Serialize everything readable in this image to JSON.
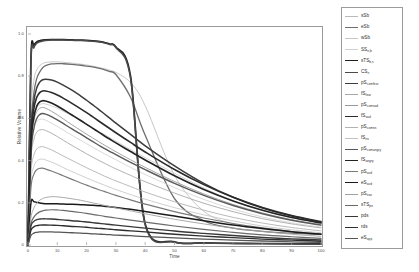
{
  "figure": {
    "xlabel": "Time",
    "ylabel": "Relative Volume"
  },
  "chart_data": {
    "type": "line",
    "title": "",
    "xlabel": "Time",
    "ylabel": "Relative Volume",
    "xlim": [
      0,
      100
    ],
    "ylim": [
      0,
      1.0
    ],
    "xticks": [
      0,
      10,
      20,
      30,
      40,
      50,
      60,
      70,
      80,
      90,
      100
    ],
    "xtick_labels": [
      "0",
      "10",
      "20",
      "30",
      "40",
      "50",
      "60",
      "70",
      "80",
      "90",
      "100"
    ],
    "yticks": [
      0,
      0.2,
      0.4,
      0.6,
      0.8,
      1.0
    ],
    "ytick_labels": [
      "0",
      "0.2",
      "0.4",
      "0.6",
      "0.8",
      "1.0"
    ],
    "grid": false,
    "legend_position": "right-outside",
    "x": [
      0,
      1,
      2,
      3,
      4,
      5,
      6,
      8,
      10,
      12,
      15,
      18,
      20,
      22,
      24,
      26,
      28,
      30,
      35,
      40,
      50,
      60,
      70,
      80,
      90,
      100
    ],
    "series": [
      {
        "name": "sSb",
        "color": "#b9b9b9",
        "width": 0.8,
        "values": [
          0.0,
          0.62,
          0.78,
          0.83,
          0.85,
          0.86,
          0.865,
          0.868,
          0.868,
          0.866,
          0.862,
          0.857,
          0.853,
          0.848,
          0.842,
          0.836,
          0.828,
          0.818,
          0.77,
          0.66,
          0.33,
          0.16,
          0.1,
          0.075,
          0.062,
          0.055
        ]
      },
      {
        "name": "eSb",
        "color": "#6e6e6e",
        "width": 1.3,
        "values": [
          0.0,
          0.55,
          0.72,
          0.79,
          0.82,
          0.84,
          0.85,
          0.858,
          0.86,
          0.859,
          0.856,
          0.852,
          0.848,
          0.844,
          0.838,
          0.831,
          0.822,
          0.808,
          0.7,
          0.52,
          0.22,
          0.115,
          0.08,
          0.065,
          0.056,
          0.05
        ]
      },
      {
        "name": "wSb",
        "color": "#c6c6c6",
        "width": 0.8,
        "values": [
          0.0,
          0.48,
          0.6,
          0.65,
          0.665,
          0.67,
          0.668,
          0.66,
          0.648,
          0.634,
          0.612,
          0.588,
          0.572,
          0.556,
          0.54,
          0.524,
          0.508,
          0.492,
          0.452,
          0.414,
          0.34,
          0.27,
          0.21,
          0.165,
          0.13,
          0.105
        ]
      },
      {
        "name": "SSn,b",
        "color": "#cfcfcf",
        "width": 0.8,
        "values": [
          0.0,
          0.44,
          0.55,
          0.585,
          0.595,
          0.597,
          0.592,
          0.578,
          0.562,
          0.545,
          0.52,
          0.496,
          0.48,
          0.464,
          0.448,
          0.433,
          0.418,
          0.404,
          0.368,
          0.334,
          0.272,
          0.216,
          0.17,
          0.133,
          0.105,
          0.085
        ]
      },
      {
        "name": "sTSb,s",
        "color": "#1f1f1f",
        "width": 1.7,
        "values": [
          0.0,
          0.88,
          0.945,
          0.962,
          0.968,
          0.971,
          0.972,
          0.973,
          0.973,
          0.973,
          0.972,
          0.971,
          0.97,
          0.968,
          0.965,
          0.96,
          0.952,
          0.938,
          0.8,
          0.1,
          0.015,
          0.01,
          0.008,
          0.007,
          0.006,
          0.005
        ]
      },
      {
        "name": "CSn",
        "color": "#4a4a4a",
        "width": 1.5,
        "values": [
          0.0,
          0.86,
          0.935,
          0.956,
          0.963,
          0.967,
          0.969,
          0.971,
          0.971,
          0.971,
          0.97,
          0.969,
          0.968,
          0.966,
          0.963,
          0.958,
          0.95,
          0.935,
          0.79,
          0.095,
          0.014,
          0.009,
          0.007,
          0.006,
          0.005,
          0.004
        ]
      },
      {
        "name": "pScomfear",
        "color": "#3c3c3c",
        "width": 1.5,
        "values": [
          0.0,
          0.52,
          0.68,
          0.745,
          0.772,
          0.783,
          0.786,
          0.782,
          0.772,
          0.758,
          0.734,
          0.706,
          0.686,
          0.665,
          0.644,
          0.622,
          0.6,
          0.578,
          0.524,
          0.47,
          0.375,
          0.292,
          0.226,
          0.175,
          0.137,
          0.108
        ]
      },
      {
        "name": "fSfear",
        "color": "#a8a8a8",
        "width": 0.9,
        "values": [
          0.0,
          0.4,
          0.5,
          0.535,
          0.545,
          0.547,
          0.543,
          0.53,
          0.514,
          0.497,
          0.472,
          0.448,
          0.432,
          0.417,
          0.402,
          0.388,
          0.374,
          0.361,
          0.33,
          0.3,
          0.246,
          0.198,
          0.158,
          0.125,
          0.1,
          0.081
        ]
      },
      {
        "name": "pScomsad",
        "color": "#9a9a9a",
        "width": 0.9,
        "values": [
          0.0,
          0.46,
          0.585,
          0.632,
          0.648,
          0.652,
          0.648,
          0.634,
          0.617,
          0.598,
          0.57,
          0.543,
          0.525,
          0.508,
          0.491,
          0.474,
          0.458,
          0.442,
          0.404,
          0.368,
          0.301,
          0.242,
          0.192,
          0.152,
          0.12,
          0.096
        ]
      },
      {
        "name": "fSsad",
        "color": "#2b2b2b",
        "width": 1.6,
        "values": [
          0.0,
          0.5,
          0.645,
          0.7,
          0.722,
          0.73,
          0.73,
          0.723,
          0.711,
          0.696,
          0.671,
          0.645,
          0.627,
          0.608,
          0.589,
          0.57,
          0.551,
          0.532,
          0.486,
          0.441,
          0.358,
          0.286,
          0.226,
          0.178,
          0.14,
          0.111
        ]
      },
      {
        "name": "pScomns",
        "color": "#b2b2b2",
        "width": 0.9,
        "values": [
          0.0,
          0.34,
          0.425,
          0.455,
          0.464,
          0.466,
          0.462,
          0.451,
          0.437,
          0.422,
          0.401,
          0.38,
          0.366,
          0.353,
          0.34,
          0.327,
          0.315,
          0.304,
          0.277,
          0.251,
          0.205,
          0.165,
          0.131,
          0.104,
          0.083,
          0.067
        ]
      },
      {
        "name": "fSns",
        "color": "#c2c2c2",
        "width": 0.8,
        "values": [
          0.0,
          0.3,
          0.372,
          0.398,
          0.406,
          0.407,
          0.403,
          0.393,
          0.381,
          0.367,
          0.348,
          0.33,
          0.318,
          0.306,
          0.295,
          0.284,
          0.273,
          0.263,
          0.239,
          0.217,
          0.177,
          0.143,
          0.114,
          0.09,
          0.072,
          0.058
        ]
      },
      {
        "name": "pScomangry",
        "color": "#5a5a5a",
        "width": 1.4,
        "values": [
          0.0,
          0.43,
          0.552,
          0.6,
          0.618,
          0.623,
          0.62,
          0.608,
          0.593,
          0.576,
          0.55,
          0.525,
          0.508,
          0.491,
          0.474,
          0.458,
          0.443,
          0.428,
          0.392,
          0.357,
          0.292,
          0.235,
          0.187,
          0.148,
          0.117,
          0.094
        ]
      },
      {
        "name": "fSangry",
        "color": "#222222",
        "width": 1.6,
        "values": [
          0.0,
          0.47,
          0.605,
          0.658,
          0.678,
          0.684,
          0.682,
          0.673,
          0.659,
          0.642,
          0.616,
          0.59,
          0.572,
          0.554,
          0.536,
          0.518,
          0.501,
          0.484,
          0.443,
          0.403,
          0.328,
          0.263,
          0.209,
          0.165,
          0.13,
          0.104
        ]
      },
      {
        "name": "pSavd",
        "color": "#7a7a7a",
        "width": 1.2,
        "values": [
          0.0,
          0.27,
          0.335,
          0.357,
          0.363,
          0.364,
          0.36,
          0.351,
          0.34,
          0.328,
          0.311,
          0.294,
          0.284,
          0.273,
          0.263,
          0.254,
          0.244,
          0.235,
          0.214,
          0.194,
          0.158,
          0.128,
          0.102,
          0.081,
          0.064,
          0.052
        ]
      },
      {
        "name": "eSavd",
        "color": "#1a1a1a",
        "width": 1.5,
        "values": [
          0.0,
          0.2,
          0.205,
          0.202,
          0.199,
          0.197,
          0.196,
          0.195,
          0.195,
          0.194,
          0.193,
          0.191,
          0.19,
          0.188,
          0.186,
          0.184,
          0.181,
          0.178,
          0.169,
          0.159,
          0.137,
          0.115,
          0.095,
          0.078,
          0.063,
          0.051
        ]
      },
      {
        "name": "pSsso",
        "color": "#a0a0a0",
        "width": 0.9,
        "values": [
          0.0,
          0.13,
          0.175,
          0.198,
          0.212,
          0.22,
          0.225,
          0.229,
          0.228,
          0.225,
          0.219,
          0.212,
          0.206,
          0.2,
          0.194,
          0.188,
          0.182,
          0.176,
          0.162,
          0.148,
          0.122,
          0.1,
          0.08,
          0.064,
          0.051,
          0.041
        ]
      },
      {
        "name": "sTSpe",
        "color": "#6a6a6a",
        "width": 1.2,
        "values": [
          0.0,
          0.1,
          0.132,
          0.148,
          0.157,
          0.162,
          0.165,
          0.167,
          0.166,
          0.164,
          0.159,
          0.154,
          0.15,
          0.145,
          0.141,
          0.136,
          0.132,
          0.128,
          0.118,
          0.108,
          0.09,
          0.074,
          0.06,
          0.048,
          0.039,
          0.031
        ]
      },
      {
        "name": "pds",
        "color": "#383838",
        "width": 1.4,
        "values": [
          0.0,
          0.09,
          0.112,
          0.12,
          0.123,
          0.124,
          0.124,
          0.123,
          0.121,
          0.119,
          0.115,
          0.112,
          0.109,
          0.106,
          0.103,
          0.1,
          0.097,
          0.094,
          0.087,
          0.08,
          0.066,
          0.055,
          0.045,
          0.036,
          0.029,
          0.024
        ]
      },
      {
        "name": "rds",
        "color": "#2e2e2e",
        "width": 1.4,
        "values": [
          0.0,
          0.07,
          0.086,
          0.092,
          0.094,
          0.095,
          0.095,
          0.094,
          0.093,
          0.091,
          0.088,
          0.086,
          0.084,
          0.081,
          0.079,
          0.077,
          0.075,
          0.072,
          0.067,
          0.062,
          0.051,
          0.042,
          0.035,
          0.028,
          0.023,
          0.018
        ]
      },
      {
        "name": "eSapp",
        "color": "#555555",
        "width": 1.3,
        "values": [
          0.0,
          0.045,
          0.056,
          0.06,
          0.062,
          0.062,
          0.062,
          0.062,
          0.061,
          0.06,
          0.058,
          0.056,
          0.055,
          0.053,
          0.052,
          0.05,
          0.049,
          0.047,
          0.044,
          0.04,
          0.034,
          0.028,
          0.023,
          0.019,
          0.015,
          0.012
        ]
      }
    ]
  },
  "legend": {
    "items": [
      {
        "base": "sSb",
        "sub": "",
        "color": "#b9b9b9",
        "width": 0.8
      },
      {
        "base": "eSb",
        "sub": "",
        "color": "#6e6e6e",
        "width": 1.3
      },
      {
        "base": "wSb",
        "sub": "",
        "color": "#c6c6c6",
        "width": 0.8
      },
      {
        "base": "SS",
        "sub": "n,b",
        "color": "#cfcfcf",
        "width": 0.8
      },
      {
        "base": "sTS",
        "sub": "b,s",
        "color": "#1f1f1f",
        "width": 1.7
      },
      {
        "base": "CS",
        "sub": "n",
        "color": "#4a4a4a",
        "width": 1.5
      },
      {
        "base": "pS",
        "sub": "comfear",
        "color": "#3c3c3c",
        "width": 1.5
      },
      {
        "base": "fS",
        "sub": "fear",
        "color": "#a8a8a8",
        "width": 0.9
      },
      {
        "base": "pS",
        "sub": "comsad",
        "color": "#9a9a9a",
        "width": 0.9
      },
      {
        "base": "fS",
        "sub": "sad",
        "color": "#2b2b2b",
        "width": 1.6
      },
      {
        "base": "pS",
        "sub": "comns",
        "color": "#b2b2b2",
        "width": 0.9
      },
      {
        "base": "fS",
        "sub": "ns",
        "color": "#c2c2c2",
        "width": 0.8
      },
      {
        "base": "pS",
        "sub": "comangry",
        "color": "#5a5a5a",
        "width": 1.4
      },
      {
        "base": "fS",
        "sub": "angry",
        "color": "#222222",
        "width": 1.6
      },
      {
        "base": "pS",
        "sub": "avd",
        "color": "#7a7a7a",
        "width": 1.2
      },
      {
        "base": "eS",
        "sub": "avd",
        "color": "#1a1a1a",
        "width": 1.5
      },
      {
        "base": "pS",
        "sub": "sso",
        "color": "#a0a0a0",
        "width": 0.9
      },
      {
        "base": "sTS",
        "sub": "pe",
        "color": "#6a6a6a",
        "width": 1.2
      },
      {
        "base": "pds",
        "sub": "",
        "color": "#383838",
        "width": 1.4
      },
      {
        "base": "rds",
        "sub": "",
        "color": "#2e2e2e",
        "width": 1.4
      },
      {
        "base": "eS",
        "sub": "app",
        "color": "#555555",
        "width": 1.3
      }
    ]
  }
}
